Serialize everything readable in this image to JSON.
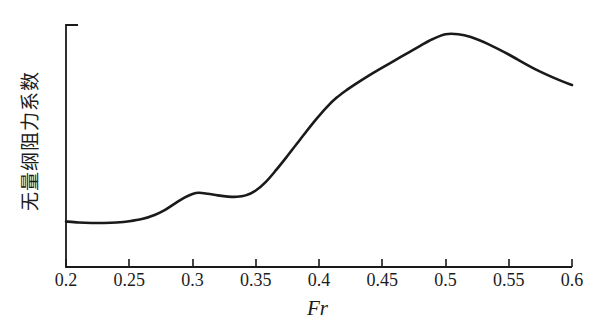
{
  "chart_data": {
    "type": "line",
    "title": "",
    "subtitle": "",
    "xlabel": "Fr",
    "ylabel": "无量纲阻力系数",
    "xlim": [
      0.2,
      0.6
    ],
    "ylim": [
      0,
      1
    ],
    "grid": false,
    "legend": null,
    "xticks": [
      "0.2",
      "0.25",
      "0.3",
      "0.35",
      "0.4",
      "0.45",
      "0.5",
      "0.55",
      "0.6"
    ],
    "xtick_values": [
      0.2,
      0.25,
      0.3,
      0.35,
      0.4,
      0.45,
      0.5,
      0.55,
      0.6
    ],
    "yticks": [],
    "ytick_values": [],
    "line_color": "#1a1a1a",
    "line_width": 2.6,
    "series": [
      {
        "name": "无量纲阻力系数",
        "x": [
          0.2,
          0.21,
          0.22,
          0.23,
          0.24,
          0.25,
          0.26,
          0.27,
          0.278,
          0.286,
          0.294,
          0.3,
          0.305,
          0.312,
          0.32,
          0.328,
          0.335,
          0.342,
          0.35,
          0.358,
          0.366,
          0.374,
          0.382,
          0.39,
          0.398,
          0.406,
          0.414,
          0.422,
          0.43,
          0.44,
          0.45,
          0.46,
          0.47,
          0.48,
          0.49,
          0.5,
          0.51,
          0.52,
          0.535,
          0.55,
          0.57,
          0.59,
          0.6
        ],
        "y": [
          0.188,
          0.184,
          0.182,
          0.182,
          0.184,
          0.189,
          0.198,
          0.215,
          0.235,
          0.262,
          0.288,
          0.302,
          0.307,
          0.303,
          0.296,
          0.291,
          0.29,
          0.296,
          0.316,
          0.352,
          0.4,
          0.452,
          0.506,
          0.56,
          0.612,
          0.66,
          0.7,
          0.732,
          0.76,
          0.793,
          0.824,
          0.854,
          0.884,
          0.914,
          0.942,
          0.962,
          0.962,
          0.95,
          0.918,
          0.878,
          0.82,
          0.772,
          0.752
        ]
      }
    ],
    "annotations": [
      {
        "label": "local-hump-peak",
        "x": 0.305,
        "y": 0.307
      },
      {
        "label": "local-trough",
        "x": 0.335,
        "y": 0.29
      },
      {
        "label": "global-maximum",
        "x": 0.502,
        "y": 0.963
      }
    ]
  },
  "axis": {
    "y_axis_top_tick": true,
    "tick_direction": "inward"
  }
}
